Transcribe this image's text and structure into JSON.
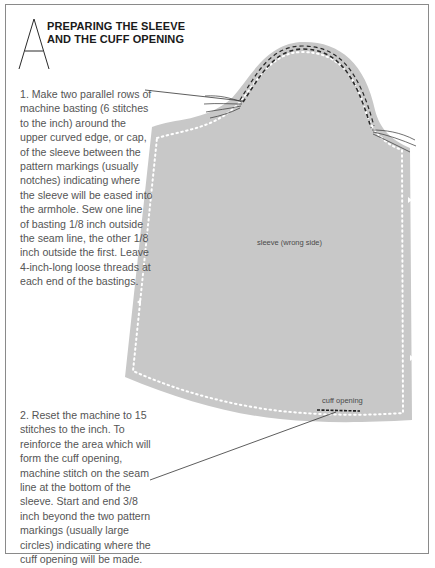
{
  "header": {
    "initial_letter": "A",
    "title_line_1": "PREPARING THE SLEEVE",
    "title_line_2": "AND THE CUFF OPENING"
  },
  "steps": [
    {
      "number": "1",
      "text": "1. Make two parallel rows of\nmachine basting (6 stitches\nto the inch) around the\nupper curved edge, or cap,\nof the sleeve between the\npattern markings (usually\nnotches) indicating where\nthe sleeve will be eased into\nthe armhole. Sew one line\nof basting 1/8 inch outside\nthe seam line, the other 1/8\ninch outside the first. Leave\n4-inch-long loose threads at\neach end of the bastings."
    },
    {
      "number": "2",
      "text": "2. Reset the machine to 15\nstitches to the inch. To\nreinforce the area which will\nform the cuff opening,\nmachine stitch on the seam\nline at the bottom of the\nsleeve. Start and end 3/8\ninch beyond the two pattern\nmarkings (usually large\ncircles) indicating where the\ncuff opening will be made."
    }
  ],
  "illustration": {
    "sleeve_label": "sleeve (wrong side)",
    "cuff_label": "cuff opening",
    "fabric_color": "#c8c8c8",
    "stitch_color": "#ffffff",
    "basting_color": "#2a2a2a",
    "leader_line_color": "#333333"
  }
}
